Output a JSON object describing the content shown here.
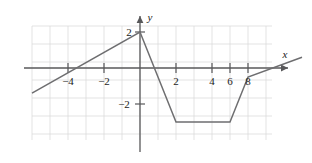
{
  "figure": {
    "title": "",
    "background_color": "#ffffff",
    "grid_color": "#dcdcdc",
    "axis_color": "#58585a",
    "curve_color": "#6e6e70"
  },
  "chart_data": {
    "type": "line",
    "title": "",
    "xlabel": "x",
    "ylabel": "y",
    "grid": true,
    "legend": "none",
    "xlim": [
      -6.5,
      8.9
    ],
    "ylim": [
      -4.0,
      3.5
    ],
    "xticks": [
      -4,
      -2,
      2,
      4,
      6,
      8
    ],
    "xtick_labels": [
      "−4",
      "−2",
      "2",
      "4",
      "6",
      "8"
    ],
    "yticks": [
      2,
      -2
    ],
    "ytick_labels": [
      "2",
      "−2"
    ],
    "grid_step": 1,
    "series": [
      {
        "name": "piecewise-linear-function",
        "x": [
          -6.0,
          0.0,
          2.0,
          5.0,
          6.0,
          9.0
        ],
        "y": [
          -1.4,
          2.0,
          -3.0,
          -3.0,
          -0.5,
          0.6
        ]
      }
    ],
    "vertices": [
      {
        "x": -6.0,
        "y": -1.4,
        "role": "left-endpoint"
      },
      {
        "x": 0.0,
        "y": 2.0,
        "role": "peak"
      },
      {
        "x": 2.0,
        "y": -3.0,
        "role": "valley-start"
      },
      {
        "x": 5.0,
        "y": -3.0,
        "role": "valley-end"
      },
      {
        "x": 6.0,
        "y": -0.5,
        "role": "knee"
      },
      {
        "x": 9.0,
        "y": 0.6,
        "role": "right-endpoint"
      }
    ]
  },
  "labels": {
    "x_axis": "x",
    "y_axis": "y",
    "x_neg4": "−4",
    "x_neg2": "−2",
    "x_2": "2",
    "x_4": "4",
    "x_6": "6",
    "x_8": "8",
    "y_2": "2",
    "y_neg2": "−2"
  }
}
